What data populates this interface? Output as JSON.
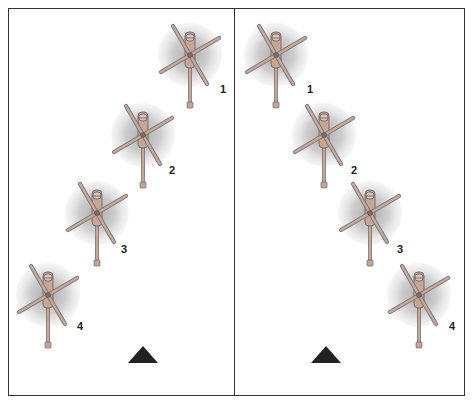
{
  "figure": {
    "panels": [
      {
        "id": "left",
        "formation": "echelon-left",
        "helicopters": [
          {
            "number": "1",
            "cx": 190,
            "cy": 55,
            "label_x": 220,
            "label_y": 83
          },
          {
            "number": "2",
            "cx": 143,
            "cy": 135,
            "label_x": 169,
            "label_y": 164
          },
          {
            "number": "3",
            "cx": 97,
            "cy": 213,
            "label_x": 121,
            "label_y": 243
          },
          {
            "number": "4",
            "cx": 48,
            "cy": 295,
            "label_x": 77,
            "label_y": 320
          }
        ],
        "marker": {
          "shape": "triangle",
          "x": 143,
          "y": 355
        }
      },
      {
        "id": "right",
        "formation": "echelon-right",
        "helicopters": [
          {
            "number": "1",
            "cx": 276,
            "cy": 55,
            "label_x": 307,
            "label_y": 83
          },
          {
            "number": "2",
            "cx": 324,
            "cy": 135,
            "label_x": 351,
            "label_y": 164
          },
          {
            "number": "3",
            "cx": 370,
            "cy": 213,
            "label_x": 397,
            "label_y": 243
          },
          {
            "number": "4",
            "cx": 419,
            "cy": 295,
            "label_x": 449,
            "label_y": 320
          }
        ],
        "marker": {
          "shape": "triangle",
          "x": 326,
          "y": 355
        }
      }
    ],
    "colors": {
      "border": "#333333",
      "rotor_disc": "#b9b9b9",
      "rotor_blade": "#c8a89a",
      "fuselage": "#c9a596",
      "marker": "#222222",
      "label": "#222222"
    }
  },
  "labels": {
    "left": [
      "1",
      "2",
      "3",
      "4"
    ],
    "right": [
      "1",
      "2",
      "3",
      "4"
    ]
  }
}
